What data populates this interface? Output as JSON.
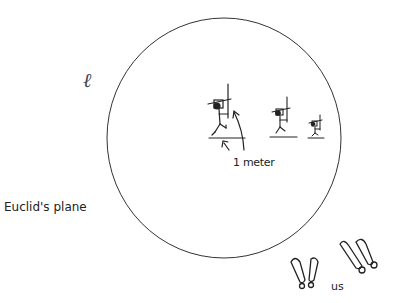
{
  "diagram": {
    "plane_symbol": "ℓ",
    "plane_label": "Euclid's plane",
    "scale_label": "1 meter",
    "observer_label": "us",
    "figures": [
      {
        "name": "large-figure",
        "scale": 1.0
      },
      {
        "name": "medium-figure",
        "scale": 0.75
      },
      {
        "name": "small-figure",
        "scale": 0.55
      }
    ],
    "colors": {
      "stroke": "#222222",
      "background": "#ffffff"
    }
  }
}
